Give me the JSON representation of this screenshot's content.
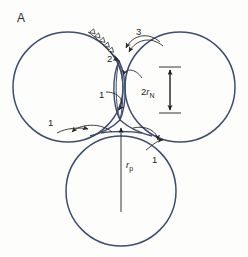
{
  "figure": {
    "panel_label": "A",
    "stroke_color": "#3e4d6e",
    "annotation_color": "#2a2a2a",
    "background": "#fdfdfc"
  },
  "circles": [
    {
      "name": "left-circle",
      "cx": 68,
      "cy": 87,
      "r": 55
    },
    {
      "name": "right-circle",
      "cx": 180,
      "cy": 87,
      "r": 55
    },
    {
      "name": "bottom-circle",
      "cx": 121,
      "cy": 191,
      "r": 55
    }
  ],
  "annotations": [
    {
      "id": "label-1-neck",
      "text": "1",
      "x": 99,
      "y": 98,
      "kind": "curved-arrow"
    },
    {
      "id": "label-1-left",
      "text": "1",
      "x": 48,
      "y": 126,
      "kind": "curved-arrow"
    },
    {
      "id": "label-1-right",
      "text": "1",
      "x": 152,
      "y": 163,
      "kind": "curved-arrow"
    },
    {
      "id": "label-2",
      "text": "2",
      "x": 107,
      "y": 62,
      "kind": "barbed-arrow"
    },
    {
      "id": "label-3",
      "text": "3",
      "x": 136,
      "y": 35,
      "kind": "curved-arrow"
    }
  ],
  "dimensions": [
    {
      "id": "neck-diameter",
      "label_prefix": "2",
      "label_symbol": "r",
      "label_subscript": "N",
      "label_x": 147,
      "label_y": 95,
      "top_y": 67,
      "bottom_y": 113,
      "line_x": 170,
      "tick_half_width": 11,
      "kind": "double-headed-vertical"
    },
    {
      "id": "pore-radius",
      "label_prefix": "",
      "label_symbol": "r",
      "label_subscript": "p",
      "label_x": 126,
      "label_y": 164,
      "arrow_from_y": 212,
      "arrow_to_y": 126,
      "line_x": 121,
      "kind": "single-headed-up"
    }
  ]
}
